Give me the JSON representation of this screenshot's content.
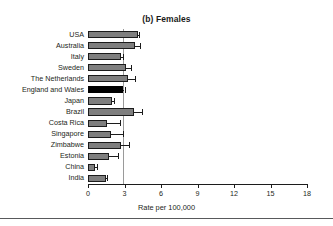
{
  "figure": {
    "title": "(b) Females",
    "xlabel": "Rate per 100,000"
  },
  "axis": {
    "ticks": [
      "0",
      "3",
      "6",
      "9",
      "12",
      "15",
      "18"
    ]
  },
  "chart_data": {
    "type": "bar",
    "orientation": "horizontal",
    "title": "(b) Females",
    "xlabel": "Rate per 100,000",
    "ylabel": "",
    "xlim": [
      0,
      18
    ],
    "xticks": [
      0,
      3,
      6,
      9,
      12,
      15,
      18
    ],
    "grid": false,
    "legend": false,
    "reference_line": 2.9,
    "highlight_category": "England and Wales",
    "categories": [
      "USA",
      "Australia",
      "Italy",
      "Sweden",
      "The Netherlands",
      "England and Wales",
      "Japan",
      "Brazil",
      "Costa Rica",
      "Singapore",
      "Zimbabwe",
      "Estonia",
      "China",
      "India"
    ],
    "values": [
      4.1,
      3.9,
      2.7,
      3.1,
      3.3,
      2.9,
      2.0,
      3.8,
      1.6,
      1.9,
      2.7,
      1.7,
      0.6,
      1.5
    ],
    "error_high": [
      4.2,
      4.3,
      2.9,
      3.5,
      3.9,
      3.0,
      2.1,
      4.4,
      2.6,
      2.9,
      3.4,
      2.5,
      0.7,
      1.6
    ],
    "colors": {
      "bar": "#7f7f7f",
      "highlight": "#000000",
      "outline": "#1c1c1c",
      "reference_line": "#9a9a9a"
    }
  }
}
